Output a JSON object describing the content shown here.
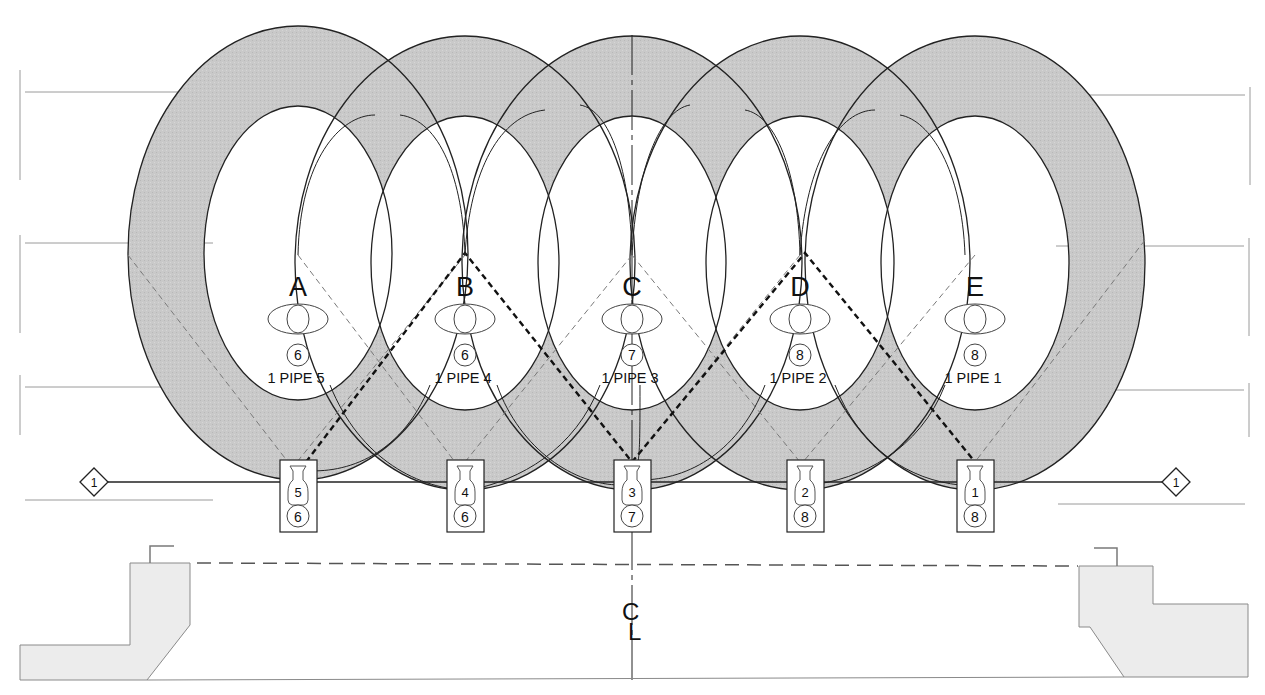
{
  "diagram": {
    "colors": {
      "ring_fill": "#c9c9c9",
      "stroke": "#222222",
      "grid_line": "#9a9a9a",
      "structure_fill": "#ececec",
      "structure_stroke": "#8a8a8a",
      "aim_dashed": "#7a7a7a",
      "aim_bold": "#111111"
    },
    "rings": [
      {
        "id": "A",
        "label": "A",
        "cx": 298,
        "cy": 253,
        "orx": 170,
        "ory": 227,
        "irx": 94,
        "iry": 147,
        "pipe_text": "1 PIPE 5",
        "circle_num": "6",
        "fixture_num": "5",
        "fixture_circle": "6",
        "fixture_x": 298
      },
      {
        "id": "B",
        "label": "B",
        "cx": 465,
        "cy": 263,
        "orx": 170,
        "ory": 227,
        "irx": 94,
        "iry": 147,
        "pipe_text": "1 PIPE 4",
        "circle_num": "6",
        "fixture_num": "4",
        "fixture_circle": "6",
        "fixture_x": 465
      },
      {
        "id": "C",
        "label": "C",
        "cx": 632,
        "cy": 263,
        "orx": 170,
        "ory": 227,
        "irx": 94,
        "iry": 147,
        "pipe_text": "1 PIPE 3",
        "circle_num": "7",
        "fixture_num": "3",
        "fixture_circle": "7",
        "fixture_x": 632
      },
      {
        "id": "D",
        "label": "D",
        "cx": 800,
        "cy": 263,
        "orx": 170,
        "ory": 227,
        "irx": 94,
        "iry": 147,
        "pipe_text": "1 PIPE 2",
        "circle_num": "8",
        "fixture_num": "2",
        "fixture_circle": "8",
        "fixture_x": 805
      },
      {
        "id": "E",
        "label": "E",
        "cx": 975,
        "cy": 263,
        "orx": 170,
        "ory": 227,
        "irx": 94,
        "iry": 147,
        "pipe_text": "1 PIPE 1",
        "circle_num": "8",
        "fixture_num": "1",
        "fixture_circle": "8",
        "fixture_x": 975
      }
    ],
    "pipe": {
      "y": 482,
      "x1": 108,
      "x2": 1162,
      "left_tag": "1",
      "right_tag": "1"
    },
    "centerline": {
      "x": 632,
      "label_c": "C",
      "label_l": "L"
    },
    "stage_edge_y": 563
  }
}
